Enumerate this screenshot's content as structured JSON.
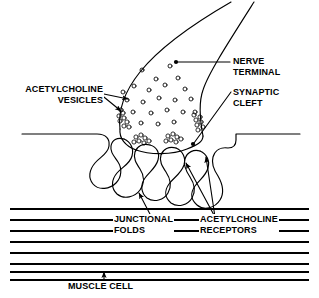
{
  "figure": {
    "width": 319,
    "height": 298,
    "background_color": "#FFFFFF",
    "ink_color": "#000000"
  },
  "labels": {
    "acetylcholine_vesicles": {
      "line1": "ACETYLCHOLINE",
      "line2": "VESICLES",
      "text": "ACETYLCHOLINE\nVESICLES",
      "align": "right"
    },
    "nerve_terminal": {
      "line1": "NERVE",
      "line2": "TERMINAL",
      "text": "NERVE\nTERMINAL",
      "align": "left"
    },
    "synaptic_cleft": {
      "line1": "SYNAPTIC",
      "line2": "CLEFT",
      "text": "SYNAPTIC\nCLEFT",
      "align": "left"
    },
    "junctional_folds": {
      "line1": "JUNCTIONAL",
      "line2": "FOLDS",
      "text": "JUNCTIONAL\nFOLDS",
      "align": "left"
    },
    "acetylcholine_receptors": {
      "line1": "ACETYLCHOLINE",
      "line2": "RECEPTORS",
      "text": "ACETYLCHOLINE\nRECEPTORS",
      "align": "left"
    },
    "muscle_cell": {
      "line1": "MUSCLE CELL",
      "text": "MUSCLE CELL",
      "align": "left"
    }
  },
  "structures": {
    "nerve_terminal_bouton": "bulbous axon ending",
    "axon_shaft": "two diverging lines to upper right",
    "free_vesicles_count": 22,
    "docked_vesicle_clusters_count": 5,
    "junctional_folds_count": 4,
    "muscle_striation_lines_count": 8,
    "synaptic_cleft": "gap between nerve terminal membrane and muscle membrane"
  },
  "leader_lines": {
    "nerve_terminal": "horizontal line with dot terminus inside bouton",
    "synaptic_cleft": "diagonal line with dot terminus at cleft",
    "acetylcholine_vesicles": "two arrows to free vesicle and docked cluster",
    "junctional_folds": "arrow pointing up into a fold",
    "acetylcholine_receptors": "two arrows pointing up to fold crests",
    "muscle_cell": "short vertical arrow pointing up into striations"
  }
}
